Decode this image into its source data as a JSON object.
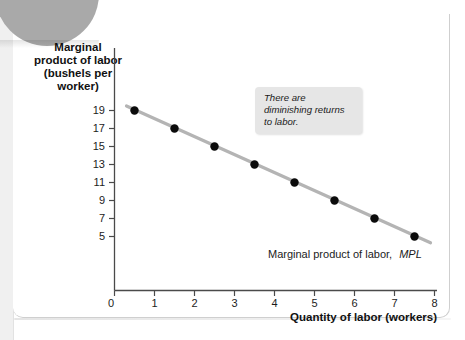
{
  "figure": {
    "callout": "There are diminishing returns to labor.",
    "series_label_main": "Marginal product of labor,",
    "series_label_em": "MPL"
  },
  "chart_data": {
    "type": "scatter",
    "title": "",
    "xlabel": "Quantity of labor (workers)",
    "ylabel": "Marginal product of labor (bushels per worker)",
    "ylabel_lines": [
      "Marginal",
      "product of labor",
      "(bushels per",
      "worker)"
    ],
    "x": [
      0.5,
      1.5,
      2.5,
      3.5,
      4.5,
      5.5,
      6.5,
      7.5
    ],
    "values": [
      19,
      17,
      15,
      13,
      11,
      9,
      7,
      5
    ],
    "series": [
      {
        "name": "Marginal product of labor, MPL",
        "x": [
          0.5,
          1.5,
          2.5,
          3.5,
          4.5,
          5.5,
          6.5,
          7.5
        ],
        "values": [
          19,
          17,
          15,
          13,
          11,
          9,
          7,
          5
        ]
      }
    ],
    "trendline": {
      "x0": 0.3,
      "y0": 19.5,
      "x1": 7.9,
      "y1": 4.3
    },
    "xlim": [
      0,
      8
    ],
    "ylim": [
      0,
      20.5
    ],
    "xticks": [
      0,
      1,
      2,
      3,
      4,
      5,
      6,
      7,
      8
    ],
    "xtick_labels": [
      "0",
      "1",
      "2",
      "3",
      "4",
      "5",
      "6",
      "7",
      "8"
    ],
    "yticks": [
      5,
      7,
      9,
      11,
      13,
      15,
      17,
      19
    ],
    "ytick_labels": [
      "5",
      "7",
      "9",
      "11",
      "13",
      "15",
      "17",
      "19"
    ],
    "y_origin_label": "0",
    "grid": false,
    "legend_position": "none",
    "annotations": [
      {
        "text": "There are diminishing returns to labor.",
        "style": "italic-callout"
      },
      {
        "text": "Marginal product of labor, MPL",
        "style": "series-label"
      }
    ],
    "colors": {
      "line": "#b4b4b4",
      "marker": "#0b0b0b",
      "axis": "#4a4a4a",
      "callout_bg": "#e6e6e6",
      "tab": "#a9a9a9"
    }
  }
}
